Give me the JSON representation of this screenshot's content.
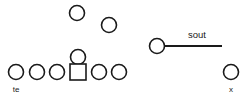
{
  "diagram": {
    "background_color": "#ffffff",
    "stroke_color": "#1a1a1a",
    "width": 249,
    "height": 100,
    "offense": {
      "line_label": "offensive-line",
      "linemen": [
        {
          "id": "lineman-1",
          "shape": "circle",
          "cx": 16,
          "cy": 72,
          "r": 7.5
        },
        {
          "id": "lineman-2",
          "shape": "circle",
          "cx": 37,
          "cy": 72,
          "r": 7.5
        },
        {
          "id": "lineman-3",
          "shape": "circle",
          "cx": 57,
          "cy": 72,
          "r": 7.5
        },
        {
          "id": "lineman-4",
          "shape": "circle",
          "cx": 99,
          "cy": 72,
          "r": 7.5
        },
        {
          "id": "lineman-5",
          "shape": "circle",
          "cx": 119,
          "cy": 72,
          "r": 7.5
        }
      ],
      "center": {
        "id": "center-square",
        "shape": "square",
        "x": 70,
        "y": 64,
        "size": 16
      },
      "quarterback": {
        "id": "quarterback",
        "shape": "circle",
        "cx": 78,
        "cy": 57,
        "r": 7.5
      },
      "backs": [
        {
          "id": "back-1",
          "shape": "circle",
          "cx": 77,
          "cy": 13,
          "r": 7.5
        },
        {
          "id": "back-2",
          "shape": "circle",
          "cx": 109,
          "cy": 25,
          "r": 7.5
        }
      ],
      "receivers": [
        {
          "id": "receiver-south",
          "shape": "circle",
          "cx": 157,
          "cy": 46,
          "r": 7.5
        },
        {
          "id": "receiver-x",
          "shape": "circle",
          "cx": 231,
          "cy": 72,
          "r": 7.5
        }
      ]
    },
    "routes": [
      {
        "id": "route-sout",
        "label": "sout",
        "label_x": 197,
        "label_y": 38,
        "x1": 164.5,
        "y1": 46,
        "x2": 222,
        "y2": 46
      }
    ],
    "position_labels": [
      {
        "id": "label-te",
        "text": "te",
        "x": 16,
        "y": 92
      },
      {
        "id": "label-x",
        "text": "x",
        "x": 231,
        "y": 92
      }
    ]
  }
}
